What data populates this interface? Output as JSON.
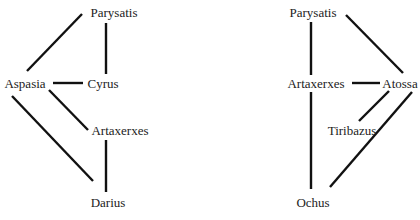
{
  "diagrams": [
    {
      "id": "left",
      "nodes": [
        {
          "key": "parysatis",
          "label": "Parysatis"
        },
        {
          "key": "aspasia",
          "label": "Aspasia"
        },
        {
          "key": "cyrus",
          "label": "Cyrus"
        },
        {
          "key": "artaxerxes",
          "label": "Artaxerxes"
        },
        {
          "key": "darius",
          "label": "Darius"
        }
      ],
      "edges": [
        [
          "Parysatis",
          "Aspasia"
        ],
        [
          "Parysatis",
          "Cyrus"
        ],
        [
          "Aspasia",
          "Cyrus"
        ],
        [
          "Aspasia",
          "Artaxerxes"
        ],
        [
          "Aspasia",
          "Darius"
        ],
        [
          "Artaxerxes",
          "Darius"
        ]
      ]
    },
    {
      "id": "right",
      "nodes": [
        {
          "key": "parysatis",
          "label": "Parysatis"
        },
        {
          "key": "artaxerxes",
          "label": "Artaxerxes"
        },
        {
          "key": "atossa",
          "label": "Atossa"
        },
        {
          "key": "tiribazus",
          "label": "Tiribazus"
        },
        {
          "key": "ochus",
          "label": "Ochus"
        }
      ],
      "edges": [
        [
          "Parysatis",
          "Artaxerxes"
        ],
        [
          "Parysatis",
          "Atossa"
        ],
        [
          "Artaxerxes",
          "Atossa"
        ],
        [
          "Artaxerxes",
          "Ochus"
        ],
        [
          "Atossa",
          "Tiribazus"
        ],
        [
          "Atossa",
          "Ochus"
        ]
      ]
    }
  ]
}
